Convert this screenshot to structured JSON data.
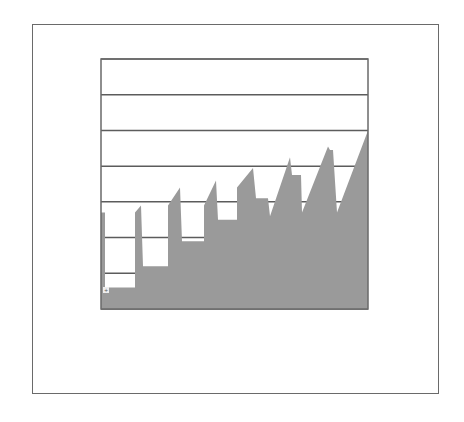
{
  "chart_data": {
    "type": "area",
    "title": "",
    "xlabel": "",
    "ylabel": "",
    "grid": true,
    "legend": null,
    "ylim": [
      0,
      7
    ],
    "y_gridlines": [
      0,
      1,
      2,
      3,
      4,
      5,
      6,
      7
    ],
    "note": "No axis tick labels are visible; y values are normalized to grid-line units (7 intervals). Sawtooth profile with a rising trend.",
    "series": [
      {
        "name": "area",
        "x": [
          0,
          4,
          4,
          34,
          34,
          40,
          42,
          42,
          67,
          67,
          79,
          81,
          81,
          103,
          103,
          115,
          117,
          117,
          136,
          136,
          152,
          155,
          155,
          167,
          169,
          189,
          191,
          191,
          200,
          201,
          227,
          229,
          229,
          232,
          236,
          267
        ],
        "values": [
          2.7,
          2.7,
          0.6,
          0.6,
          2.7,
          2.9,
          1.2,
          1.2,
          1.2,
          2.9,
          3.4,
          1.9,
          1.9,
          1.9,
          2.9,
          3.6,
          2.5,
          2.5,
          2.5,
          3.4,
          3.95,
          3.1,
          3.1,
          3.1,
          2.6,
          4.25,
          3.75,
          3.75,
          3.75,
          2.7,
          4.55,
          4.45,
          4.45,
          4.45,
          2.7,
          5.0
        ],
        "color": "#9a9a9a"
      }
    ],
    "peaks": [
      {
        "x": 40,
        "value": 2.9
      },
      {
        "x": 79,
        "value": 3.4
      },
      {
        "x": 115,
        "value": 3.6
      },
      {
        "x": 152,
        "value": 3.95
      },
      {
        "x": 189,
        "value": 4.25
      },
      {
        "x": 227,
        "value": 4.55
      },
      {
        "x": 267,
        "value": 5.0
      }
    ]
  },
  "corner_label": "+"
}
